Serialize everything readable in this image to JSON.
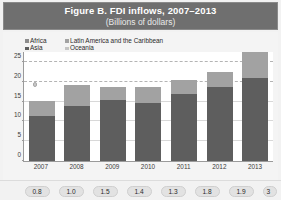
{
  "header": {
    "title": "Figure B. FDI inflows, 2007–2013",
    "subtitle": "(Billions of dollars)",
    "band_color": "#6f6f6f",
    "title_color": "#ffffff"
  },
  "chart_data": {
    "type": "bar",
    "subtype": "stacked",
    "title": "Figure B. FDI inflows, 2007–2013",
    "subtitle": "(Billions of dollars)",
    "xlabel": "",
    "ylabel": "",
    "unit": "Billions of dollars",
    "categories": [
      "2007",
      "2008",
      "2009",
      "2010",
      "2011",
      "2012",
      "2013"
    ],
    "ylim": [
      0,
      27.5
    ],
    "yticks": [
      0,
      5,
      10,
      15,
      20,
      25
    ],
    "ytick_labels": [
      "0",
      "5",
      "10",
      "15",
      "20",
      "25"
    ],
    "grid": true,
    "gridlines_dashed": [
      20,
      25
    ],
    "legend_position": "top-left",
    "series": [
      {
        "name": "Asia",
        "color": "#5e5e5e",
        "values": [
          11.3,
          14.0,
          15.5,
          14.7,
          17.0,
          18.7,
          22.5
        ]
      },
      {
        "name": "Latin America and the Caribbean",
        "color": "#a2a2a2",
        "values": [
          3.8,
          5.2,
          3.2,
          4.1,
          3.5,
          3.7,
          7.0
        ]
      }
    ],
    "totals": [
      15.1,
      19.2,
      18.7,
      18.8,
      20.5,
      22.4,
      29.5
    ],
    "annotations": [
      {
        "name": "marker-dot",
        "x_category": "2007",
        "y": 19.0
      }
    ]
  },
  "legend": {
    "items": [
      {
        "label": "Africa",
        "color": "#8c8c8c",
        "column": "a"
      },
      {
        "label": "Latin America and the Caribbean",
        "color": "#a2a2a2",
        "column": "b"
      },
      {
        "label": "Asia",
        "color": "#5e5e5e",
        "column": "a"
      },
      {
        "label": "Oceania",
        "color": "#c4c4c4",
        "column": "b"
      }
    ]
  },
  "badges": {
    "values": [
      "0.8",
      "1.0",
      "1.5",
      "1.4",
      "1.3",
      "1.8",
      "1.9"
    ],
    "partial_value": "3"
  }
}
